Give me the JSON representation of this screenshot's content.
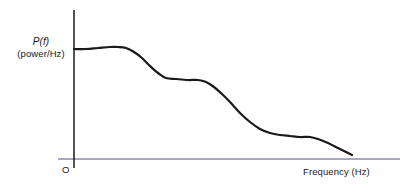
{
  "chart_data": {
    "type": "line",
    "title": "",
    "subtitle": "",
    "xlabel": "Frequency (Hz)",
    "ylabel": "P(f) (power/Hz)",
    "ylabel_line1": "P(f)",
    "ylabel_line2": "(power/Hz)",
    "origin_label": "O",
    "grid": false,
    "legend": null,
    "axis_ticks": [],
    "xlim": [
      0,
      1
    ],
    "ylim": [
      0,
      1
    ],
    "axes": {
      "x_axis_color": "#8a8aa8",
      "y_axis_color": "#1a1a1a",
      "x_axis_from_px": [
        58,
        159
      ],
      "x_axis_to_px": [
        400,
        159
      ],
      "y_axis_from_px": [
        74,
        10
      ],
      "y_axis_to_px": [
        74,
        168
      ]
    },
    "curve": {
      "name": "power spectral density",
      "color": "#1a1a1a",
      "line_width_px": 2.2,
      "description": "Power spectral density decreasing with frequency, showing a low-frequency plateau with a slight bump, a mid-frequency shelf, a steep roll-off, a second minor shelf, then a final decline toward the axis.",
      "points_px": [
        [
          74,
          49
        ],
        [
          86,
          49
        ],
        [
          98,
          48
        ],
        [
          110,
          47
        ],
        [
          118,
          47
        ],
        [
          126,
          48
        ],
        [
          134,
          52
        ],
        [
          142,
          58
        ],
        [
          150,
          66
        ],
        [
          158,
          73
        ],
        [
          166,
          78
        ],
        [
          176,
          79
        ],
        [
          188,
          80
        ],
        [
          198,
          80
        ],
        [
          206,
          82
        ],
        [
          214,
          87
        ],
        [
          222,
          94
        ],
        [
          230,
          102
        ],
        [
          240,
          113
        ],
        [
          250,
          122
        ],
        [
          260,
          129
        ],
        [
          270,
          133
        ],
        [
          280,
          135
        ],
        [
          290,
          136
        ],
        [
          300,
          137
        ],
        [
          310,
          137
        ],
        [
          318,
          139
        ],
        [
          328,
          143
        ],
        [
          338,
          148
        ],
        [
          346,
          152
        ],
        [
          352,
          155
        ]
      ],
      "normalized_points": [
        [
          0.0,
          0.74
        ],
        [
          0.04,
          0.74
        ],
        [
          0.07,
          0.75
        ],
        [
          0.11,
          0.75
        ],
        [
          0.13,
          0.75
        ],
        [
          0.16,
          0.74
        ],
        [
          0.18,
          0.72
        ],
        [
          0.21,
          0.68
        ],
        [
          0.23,
          0.63
        ],
        [
          0.26,
          0.58
        ],
        [
          0.28,
          0.54
        ],
        [
          0.31,
          0.54
        ],
        [
          0.35,
          0.53
        ],
        [
          0.38,
          0.53
        ],
        [
          0.41,
          0.52
        ],
        [
          0.43,
          0.48
        ],
        [
          0.45,
          0.44
        ],
        [
          0.48,
          0.38
        ],
        [
          0.51,
          0.31
        ],
        [
          0.54,
          0.25
        ],
        [
          0.58,
          0.2
        ],
        [
          0.61,
          0.17
        ],
        [
          0.64,
          0.16
        ],
        [
          0.67,
          0.15
        ],
        [
          0.7,
          0.15
        ],
        [
          0.73,
          0.14
        ],
        [
          0.76,
          0.13
        ],
        [
          0.79,
          0.1
        ],
        [
          0.82,
          0.07
        ],
        [
          0.85,
          0.04
        ],
        [
          0.87,
          0.03
        ]
      ]
    }
  }
}
